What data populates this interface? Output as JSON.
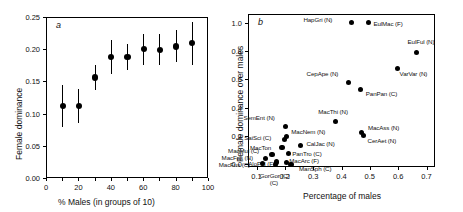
{
  "figure": {
    "panel_a_letter": "a",
    "panel_b_letter": "b"
  },
  "chart_data": [
    {
      "type": "scatter",
      "panel": "a",
      "title": "a",
      "xlabel": "% Males (in groups of 10)",
      "ylabel": "Female dominance",
      "xlim": [
        0,
        100
      ],
      "ylim": [
        0.0,
        0.25
      ],
      "grid": false,
      "legend": "none",
      "xticks": [
        0,
        10,
        20,
        30,
        40,
        50,
        60,
        70,
        80,
        90,
        100
      ],
      "xticklabels": [
        "0",
        "",
        "20",
        "",
        "40",
        "",
        "60",
        "",
        "80",
        "",
        "100"
      ],
      "yticks": [
        0.0,
        0.05,
        0.1,
        0.15,
        0.2,
        0.25
      ],
      "yticklabels": [
        "0.00",
        "0.05",
        "0.10",
        "0.15",
        "0.20",
        "0.25"
      ],
      "x": [
        10,
        20,
        30,
        40,
        50,
        60,
        70,
        80,
        90
      ],
      "values": [
        0.112,
        0.112,
        0.156,
        0.188,
        0.188,
        0.2,
        0.199,
        0.204,
        0.21
      ],
      "err_low": [
        0.079,
        0.086,
        0.136,
        0.162,
        0.168,
        0.176,
        0.176,
        0.18,
        0.176
      ],
      "err_high": [
        0.145,
        0.138,
        0.175,
        0.214,
        0.208,
        0.224,
        0.223,
        0.23,
        0.243
      ]
    },
    {
      "type": "scatter",
      "panel": "b",
      "title": "b",
      "xlabel": "Percentage of males",
      "ylabel": "Female dominance over males",
      "xlim": [
        0.07,
        0.73
      ],
      "ylim": [
        -0.02,
        1.06
      ],
      "grid": false,
      "legend": "none",
      "xticks": [
        0.1,
        0.2,
        0.3,
        0.4,
        0.5,
        0.6,
        0.7
      ],
      "xticklabels": [
        "0.1",
        "0.2",
        "0.3",
        "0.4",
        "0.5",
        "0.6",
        "0.7"
      ],
      "yticks": [
        0.0,
        0.2,
        0.4,
        0.6,
        0.8,
        1.0
      ],
      "yticklabels": [
        "0.0",
        "0.2",
        "0.4",
        "0.6",
        "0.8",
        "1.0"
      ],
      "points": [
        {
          "label": "HapGri (N)",
          "x": 0.435,
          "y": 1.0,
          "lx": -48,
          "ly": -3
        },
        {
          "label": "EulMac (F)",
          "x": 0.495,
          "y": 1.0,
          "lx": 5,
          "ly": 1
        },
        {
          "label": "EulFul (N)",
          "x": 0.665,
          "y": 0.79,
          "lx": -9,
          "ly": -10
        },
        {
          "label": "VarVar (N)",
          "x": 0.598,
          "y": 0.675,
          "lx": 2,
          "ly": 5
        },
        {
          "label": "CepApe (N)",
          "x": 0.425,
          "y": 0.575,
          "lx": -42,
          "ly": -9
        },
        {
          "label": "PanPan (C)",
          "x": 0.468,
          "y": 0.525,
          "lx": 5,
          "ly": 4
        },
        {
          "label": "MacThi (N)",
          "x": 0.378,
          "y": 0.3,
          "lx": -17,
          "ly": -10
        },
        {
          "label": "MacAss (N)",
          "x": 0.472,
          "y": 0.225,
          "lx": 6,
          "ly": -4
        },
        {
          "label": "CerAet (N)",
          "x": 0.478,
          "y": 0.2,
          "lx": 4,
          "ly": 5
        },
        {
          "label": "SemEnt (N)",
          "x": 0.202,
          "y": 0.265,
          "lx": -42,
          "ly": -9
        },
        {
          "label": "MacNem (N)",
          "x": 0.205,
          "y": 0.195,
          "lx": 5,
          "ly": -5
        },
        {
          "label": "SaiSci (C)",
          "x": 0.198,
          "y": 0.175,
          "lx": -40,
          "ly": -1
        },
        {
          "label": "CalJac (N)",
          "x": 0.255,
          "y": 0.13,
          "lx": 6,
          "ly": -2
        },
        {
          "label": "MacTon",
          "x": 0.19,
          "y": 0.12,
          "lx": -32,
          "ly": 1
        },
        {
          "label": "PanTro (C)",
          "x": 0.212,
          "y": 0.075,
          "lx": 4,
          "ly": 0
        },
        {
          "label": "MacMul (C)",
          "x": 0.155,
          "y": 0.07,
          "lx": -44,
          "ly": -3
        },
        {
          "label": "MacFas (N)",
          "x": 0.132,
          "y": 0.04,
          "lx": -44,
          "ly": -1
        },
        {
          "label": "AloPal (F)",
          "x": 0.17,
          "y": 0.015,
          "lx": -28,
          "ly": 2
        },
        {
          "label": "MacArc (F)",
          "x": 0.205,
          "y": 0.012,
          "lx": 3,
          "ly": -1
        },
        {
          "label": "MacFus (C)",
          "x": 0.122,
          "y": 0.005,
          "lx": -44,
          "ly": 2
        },
        {
          "label": "ManSph (C)",
          "x": 0.222,
          "y": 0.0,
          "lx": 8,
          "ly": 5
        },
        {
          "label": "GorGor (C)",
          "x": 0.168,
          "y": 0.0,
          "lx": -16,
          "ly": 12
        }
      ],
      "gorgor_line2": "(C)"
    }
  ]
}
